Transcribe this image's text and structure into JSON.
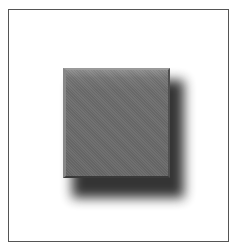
{
  "figure": {
    "frame": {
      "border_color": "#555555",
      "background": "#ffffff"
    },
    "square": {
      "face_color": "#6e6e6e",
      "highlight_color": "#9a9a9a",
      "edge_dark_color": "#3a3a3a"
    },
    "shadow": {
      "color": "#2a2a2a",
      "offset_x": 9,
      "offset_y": 12,
      "blur": 6
    }
  }
}
